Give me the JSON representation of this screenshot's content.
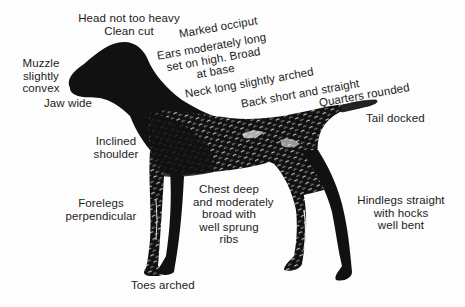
{
  "diagram": {
    "colors": {
      "background": "#fdfdfd",
      "ink": "#111111",
      "text": "#1c1c1c",
      "highlight": "#f2f2f2"
    },
    "labels": {
      "head": [
        "Head not too heavy",
        "Clean cut"
      ],
      "occiput": [
        "Marked occiput"
      ],
      "ears": [
        "Ears moderately long",
        "set on high. Broad",
        "at base"
      ],
      "neck": [
        "Neck long slightly arched"
      ],
      "back": [
        "Back short and straight"
      ],
      "quarters": [
        "Quarters rounded"
      ],
      "tail": [
        "Tail docked"
      ],
      "muzzle": [
        "Muzzle",
        "slightly",
        "convex"
      ],
      "jaw": [
        "Jaw wide"
      ],
      "shoulder": [
        "Inclined",
        "shoulder"
      ],
      "forelegs": [
        "Forelegs",
        "perpendicular"
      ],
      "chest": [
        "Chest deep",
        "and moderately",
        "broad with",
        "well sprung",
        "ribs"
      ],
      "hindlegs": [
        "Hindlegs straight",
        "with hocks",
        "well bent"
      ],
      "toes": [
        "Toes arched"
      ]
    }
  }
}
